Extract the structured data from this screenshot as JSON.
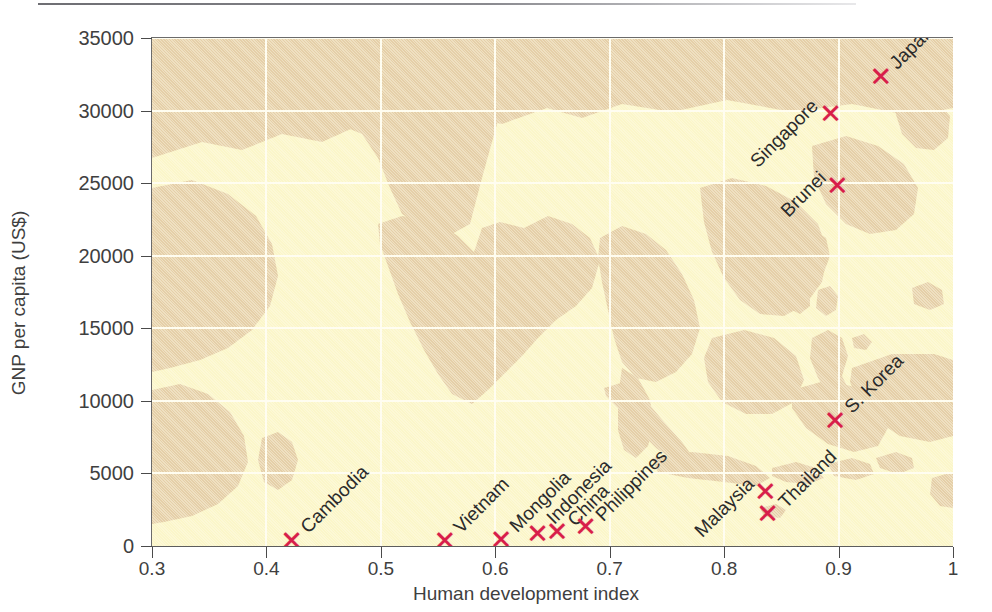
{
  "chart_data": {
    "type": "scatter",
    "title": "",
    "xlabel": "Human development index",
    "ylabel": "GNP per capita (US$)",
    "xlim": [
      0.3,
      1.0
    ],
    "ylim": [
      0,
      35000
    ],
    "xticks": [
      "0.3",
      "0.4",
      "0.5",
      "0.6",
      "0.7",
      "0.8",
      "0.9",
      "1"
    ],
    "xtick_values": [
      0.3,
      0.4,
      0.5,
      0.6,
      0.7,
      0.8,
      0.9,
      1.0
    ],
    "yticks": [
      "0",
      "5000",
      "10000",
      "15000",
      "20000",
      "25000",
      "30000",
      "35000"
    ],
    "ytick_values": [
      0,
      5000,
      10000,
      15000,
      20000,
      25000,
      30000,
      35000
    ],
    "grid": true,
    "legend": "none",
    "background": "faded-map-of-southeast-asia",
    "marker_symbol": "x",
    "marker_color": "#d81e4a",
    "points": [
      {
        "label": "Cambodia",
        "x": 0.422,
        "y": 400,
        "label_dx": 12,
        "label_dy": -10
      },
      {
        "label": "Vietnam",
        "x": 0.556,
        "y": 400,
        "label_dx": 12,
        "label_dy": -10
      },
      {
        "label": "Mongolia",
        "x": 0.605,
        "y": 500,
        "label_dx": 12,
        "label_dy": -10
      },
      {
        "label": "Indonesia",
        "x": 0.637,
        "y": 900,
        "label_dx": 12,
        "label_dy": -12
      },
      {
        "label": "China",
        "x": 0.654,
        "y": 1000,
        "label_dx": 14,
        "label_dy": -8
      },
      {
        "label": "Philippines",
        "x": 0.679,
        "y": 1400,
        "label_dx": 13,
        "label_dy": -8
      },
      {
        "label": "Malaysia",
        "x": 0.836,
        "y": 3800,
        "label_dx": -14,
        "label_dy": -10
      },
      {
        "label": "Thailand",
        "x": 0.838,
        "y": 2250,
        "label_dx": 14,
        "label_dy": -8
      },
      {
        "label": "S. Korea",
        "x": 0.897,
        "y": 8700,
        "label_dx": 13,
        "label_dy": -10
      },
      {
        "label": "Brunei",
        "x": 0.899,
        "y": 24900,
        "label_dx": -14,
        "label_dy": -10
      },
      {
        "label": "Singapore",
        "x": 0.893,
        "y": 29800,
        "label_dx": -16,
        "label_dy": -10
      },
      {
        "label": "Japan",
        "x": 0.937,
        "y": 32400,
        "label_dx": 12,
        "label_dy": -10
      }
    ]
  },
  "colors": {
    "sea": "#fbf6c9",
    "land": "#e5cfa8",
    "marker": "#d81e4a",
    "gridline": "#fffdf0",
    "axis": "#4a4a4a",
    "text": "#3f3f3f"
  }
}
